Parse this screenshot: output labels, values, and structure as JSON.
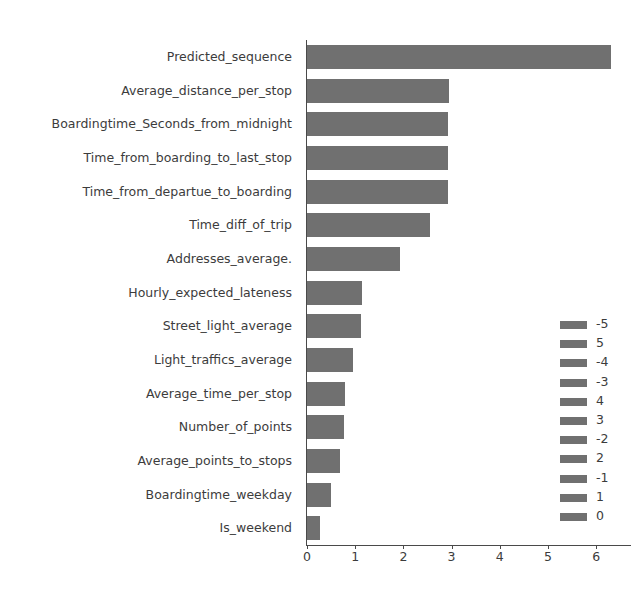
{
  "chart_data": {
    "type": "bar",
    "orientation": "horizontal",
    "title": "",
    "xlabel": "",
    "ylabel": "",
    "xlim": [
      0,
      6.75
    ],
    "ylim": [
      0,
      15
    ],
    "grid": false,
    "bar_color": "#707070",
    "axis_color": "#4a4a4a",
    "text_color": "#3c3c3c",
    "background": "#ffffff",
    "xticks": [
      0,
      1,
      2,
      3,
      4,
      5,
      6
    ],
    "xtick_labels": [
      "0",
      "1",
      "2",
      "3",
      "4",
      "5",
      "6"
    ],
    "categories": [
      "Predicted_sequence",
      "Average_distance_per_stop",
      "Boardingtime_Seconds_from_midnight",
      "Time_from_boarding_to_last_stop",
      "Time_from_departue_to_boarding",
      "Time_diff_of_trip",
      "Addresses_average.",
      "Hourly_expected_lateness",
      "Street_light_average",
      "Light_traffics_average",
      "Average_time_per_stop",
      "Number_of_points",
      "Average_points_to_stops",
      "Boardingtime_weekday",
      "Is_weekend"
    ],
    "values": [
      6.3,
      2.95,
      2.93,
      2.93,
      2.92,
      2.55,
      1.93,
      1.14,
      1.13,
      0.96,
      0.78,
      0.77,
      0.69,
      0.5,
      0.28
    ],
    "legend": {
      "position": "center right",
      "entries": [
        {
          "label": "-5",
          "color": "#707070"
        },
        {
          "label": "5",
          "color": "#707070"
        },
        {
          "label": "-4",
          "color": "#707070"
        },
        {
          "label": "-3",
          "color": "#707070"
        },
        {
          "label": "4",
          "color": "#707070"
        },
        {
          "label": "3",
          "color": "#707070"
        },
        {
          "label": "-2",
          "color": "#707070"
        },
        {
          "label": "2",
          "color": "#707070"
        },
        {
          "label": "-1",
          "color": "#707070"
        },
        {
          "label": "1",
          "color": "#707070"
        },
        {
          "label": "0",
          "color": "#707070"
        }
      ]
    }
  }
}
